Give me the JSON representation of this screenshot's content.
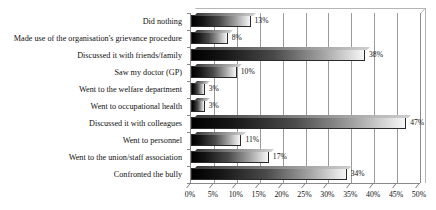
{
  "chart_data": {
    "type": "bar",
    "orientation": "horizontal",
    "title": "",
    "xlabel": "",
    "ylabel": "",
    "xlim": [
      0,
      50
    ],
    "xtick_step": 5,
    "grid": true,
    "legend": "none",
    "value_label_suffix": "%",
    "categories": [
      "Did nothing",
      "Made use of the organisation's grievance procedure",
      "Discussed it with friends/family",
      "Saw my doctor (GP)",
      "Went to the welfare department",
      "Went to occupational health",
      "Discussed it with colleagues",
      "Went to personnel",
      "Went to the union/staff association",
      "Confronted the bully"
    ],
    "values": [
      13,
      8,
      38,
      10,
      3,
      3,
      47,
      11,
      17,
      34
    ],
    "value_labels": [
      "13%",
      "8%",
      "38%",
      "10%",
      "3%",
      "3%",
      "47%",
      "11%",
      "17%",
      "34%"
    ],
    "xtick_labels": [
      "0%",
      "5%",
      "10%",
      "15%",
      "20%",
      "25%",
      "30%",
      "35%",
      "40%",
      "45%",
      "50%"
    ],
    "xtick_values": [
      0,
      5,
      10,
      15,
      20,
      25,
      30,
      35,
      40,
      45,
      50
    ],
    "colors": {
      "bar_gradient_start": "#000000",
      "bar_gradient_end": "#f6f6f6",
      "bar_border": "#2a2a2a",
      "gridline": "#9a9a9a",
      "axis": "#8a8a8a",
      "background": "#ffffff",
      "text": "#111111"
    }
  }
}
